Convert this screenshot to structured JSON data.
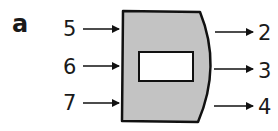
{
  "figure": {
    "part_label": "a",
    "inputs": [
      "5",
      "6",
      "7"
    ],
    "outputs": [
      "2",
      "3",
      "4"
    ],
    "colors": {
      "machine_fill": "#c3c3c3",
      "stroke": "#111111",
      "window_fill": "#ffffff"
    }
  }
}
